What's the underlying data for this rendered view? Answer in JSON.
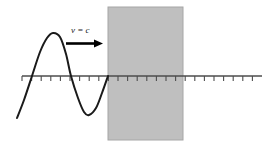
{
  "figure": {
    "background_color": "#ffffff",
    "width": 269,
    "height": 148
  },
  "annotation": {
    "velocity_label": "v = c",
    "velocity_label_parts": {
      "symbol": "v",
      "equals": "=",
      "value": "c"
    },
    "arrow_direction": "right",
    "arrow_color": "#000000"
  },
  "axis": {
    "color": "#4d4d4d",
    "y_position": 76,
    "x_start": 22,
    "x_end": 262,
    "tick_count": 25,
    "tick_spacing": 9.6,
    "tick_length": 5,
    "tick_color": "#4d4d4d"
  },
  "block": {
    "name": "medium-region",
    "fill_color": "#bfbfbf",
    "border_color": "#a6a6a6",
    "x": 108,
    "y": 7,
    "width": 75,
    "height": 133
  },
  "wave": {
    "color": "#1a1a1a",
    "stroke_width": 2,
    "start_x": 17,
    "end_x": 108,
    "peak": {
      "x": 53,
      "y": 33
    },
    "trough": {
      "x": 89,
      "y": 115
    },
    "zero_crossings": [
      32,
      71,
      108
    ],
    "cycles": 1
  },
  "chart_data": {
    "type": "line",
    "xlabel": "",
    "ylabel": "",
    "grid": false,
    "legend": null,
    "annotations": [
      "v = c"
    ],
    "series": [
      {
        "name": "incident-wave",
        "x": [
          17,
          24,
          32,
          40,
          47,
          53,
          60,
          66,
          71,
          78,
          84,
          89,
          96,
          102,
          108
        ],
        "y": [
          118,
          100,
          76,
          52,
          38,
          33,
          37,
          54,
          76,
          98,
          112,
          115,
          108,
          93,
          76
        ]
      }
    ]
  }
}
